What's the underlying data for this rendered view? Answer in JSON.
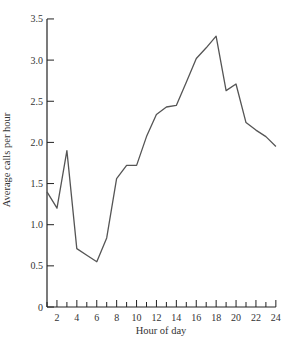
{
  "chart_data": {
    "type": "line",
    "title": "",
    "xlabel": "Hour of day",
    "ylabel": "Average calls per hour",
    "x": [
      1,
      2,
      3,
      4,
      5,
      6,
      7,
      8,
      9,
      10,
      11,
      12,
      13,
      14,
      15,
      16,
      17,
      18,
      19,
      20,
      21,
      22,
      23,
      24
    ],
    "series": [
      {
        "name": "Average calls per hour",
        "values": [
          1.4,
          1.2,
          1.9,
          0.71,
          0.63,
          0.55,
          0.84,
          1.56,
          1.72,
          1.72,
          2.07,
          2.34,
          2.43,
          2.45,
          2.73,
          3.02,
          3.15,
          3.29,
          2.63,
          2.71,
          2.24,
          2.15,
          2.07,
          1.95
        ]
      }
    ],
    "xlim": [
      1,
      24
    ],
    "ylim": [
      0,
      3.5
    ],
    "x_ticks": [
      "2",
      "4",
      "6",
      "8",
      "10",
      "12",
      "14",
      "16",
      "18",
      "20",
      "22",
      "24"
    ],
    "x_tick_values": [
      2,
      4,
      6,
      8,
      10,
      12,
      14,
      16,
      18,
      20,
      22,
      24
    ],
    "y_ticks": [
      "0",
      "0.5",
      "1.0",
      "1.5",
      "2.0",
      "2.5",
      "3.0",
      "3.5"
    ],
    "y_tick_values": [
      0,
      0.5,
      1.0,
      1.5,
      2.0,
      2.5,
      3.0,
      3.5
    ],
    "grid": false,
    "legend": null,
    "line_color": "#555555"
  }
}
